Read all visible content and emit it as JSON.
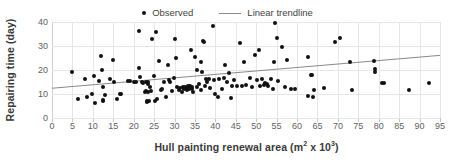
{
  "chart_data": {
    "type": "scatter",
    "title": "",
    "xlabel": "Hull painting renewal area (m² x 10³)",
    "ylabel": "Repairing time (day)",
    "xlim": [
      0,
      95
    ],
    "ylim": [
      0,
      40
    ],
    "xticks": [
      0,
      5,
      10,
      15,
      20,
      25,
      30,
      35,
      40,
      45,
      50,
      55,
      60,
      65,
      70,
      75,
      80,
      85,
      90,
      95
    ],
    "yticks": [
      0,
      10,
      20,
      30,
      40
    ],
    "grid": true,
    "legend_position": "top-center",
    "marker_color": "#111111",
    "trendline_color": "#8a8a8a",
    "gridline_color": "#e6e6e6",
    "series": [
      {
        "name": "Observed",
        "type": "scatter",
        "points": [
          [
            5.0,
            19.1
          ],
          [
            6.3,
            8.1
          ],
          [
            8.2,
            16.2
          ],
          [
            8.6,
            8.6
          ],
          [
            9.8,
            10.2
          ],
          [
            10.3,
            17.3
          ],
          [
            10.6,
            6.2
          ],
          [
            11.4,
            15.6
          ],
          [
            12.0,
            26.0
          ],
          [
            12.3,
            20.2
          ],
          [
            12.4,
            7.0
          ],
          [
            12.5,
            13.0
          ],
          [
            12.6,
            7.4
          ],
          [
            13.0,
            9.5
          ],
          [
            14.2,
            16.1
          ],
          [
            15.0,
            24.0
          ],
          [
            15.3,
            15.1
          ],
          [
            16.0,
            8.1
          ],
          [
            16.6,
            10.2
          ],
          [
            17.0,
            10.1
          ],
          [
            18.7,
            15.3
          ],
          [
            19.2,
            15.4
          ],
          [
            20.0,
            15.1
          ],
          [
            20.6,
            15.2
          ],
          [
            21.2,
            36.2
          ],
          [
            21.4,
            21.0
          ],
          [
            21.6,
            17.0
          ],
          [
            22.0,
            15.2
          ],
          [
            22.4,
            14.4
          ],
          [
            22.7,
            11.0
          ],
          [
            23.0,
            14.9
          ],
          [
            23.1,
            11.2
          ],
          [
            23.2,
            7.2
          ],
          [
            23.3,
            6.6
          ],
          [
            23.4,
            10.7
          ],
          [
            23.5,
            14.2
          ],
          [
            23.6,
            15.0
          ],
          [
            23.8,
            6.9
          ],
          [
            24.0,
            13.0
          ],
          [
            24.2,
            11.1
          ],
          [
            24.6,
            33.0
          ],
          [
            25.0,
            17.3
          ],
          [
            25.2,
            7.2
          ],
          [
            25.4,
            36.0
          ],
          [
            25.6,
            8.0
          ],
          [
            26.2,
            23.9
          ],
          [
            26.6,
            11.5
          ],
          [
            27.0,
            12.0
          ],
          [
            27.4,
            15.1
          ],
          [
            28.0,
            8.6
          ],
          [
            28.4,
            21.9
          ],
          [
            28.6,
            16.0
          ],
          [
            29.0,
            14.8
          ],
          [
            29.4,
            11.4
          ],
          [
            29.8,
            16.5
          ],
          [
            30.2,
            33.0
          ],
          [
            30.4,
            25.0
          ],
          [
            30.6,
            13.0
          ],
          [
            31.0,
            11.6
          ],
          [
            31.4,
            12.6
          ],
          [
            31.8,
            10.7
          ],
          [
            32.0,
            13.1
          ],
          [
            32.2,
            12.4
          ],
          [
            32.4,
            12.0
          ],
          [
            32.6,
            13.0
          ],
          [
            32.8,
            12.4
          ],
          [
            33.0,
            11.8
          ],
          [
            33.2,
            13.2
          ],
          [
            33.4,
            12.6
          ],
          [
            33.6,
            12.0
          ],
          [
            33.8,
            13.4
          ],
          [
            34.0,
            28.2
          ],
          [
            34.2,
            12.2
          ],
          [
            34.4,
            13.0
          ],
          [
            34.6,
            11.0
          ],
          [
            35.0,
            25.6
          ],
          [
            35.4,
            19.8
          ],
          [
            35.6,
            13.0
          ],
          [
            36.0,
            14.0
          ],
          [
            36.4,
            11.6
          ],
          [
            36.6,
            23.4
          ],
          [
            36.8,
            19.2
          ],
          [
            37.0,
            32.2
          ],
          [
            37.1,
            31.8
          ],
          [
            37.4,
            13.4
          ],
          [
            37.8,
            16.1
          ],
          [
            38.0,
            15.0
          ],
          [
            38.4,
            16.2
          ],
          [
            38.8,
            12.6
          ],
          [
            39.4,
            38.2
          ],
          [
            39.6,
            15.9
          ],
          [
            40.0,
            9.8
          ],
          [
            40.6,
            8.8
          ],
          [
            41.0,
            16.1
          ],
          [
            41.6,
            12.2
          ],
          [
            42.0,
            16.6
          ],
          [
            42.4,
            22.0
          ],
          [
            42.8,
            15.2
          ],
          [
            43.4,
            18.6
          ],
          [
            43.8,
            8.4
          ],
          [
            44.0,
            13.4
          ],
          [
            44.6,
            15.7
          ],
          [
            45.4,
            13.2
          ],
          [
            46.0,
            31.2
          ],
          [
            46.6,
            13.2
          ],
          [
            47.0,
            23.4
          ],
          [
            47.4,
            13.6
          ],
          [
            48.6,
            16.5
          ],
          [
            49.0,
            13.0
          ],
          [
            49.6,
            26.4
          ],
          [
            50.2,
            16.0
          ],
          [
            50.6,
            28.2
          ],
          [
            51.0,
            13.3
          ],
          [
            51.4,
            16.2
          ],
          [
            51.8,
            13.6
          ],
          [
            52.2,
            14.4
          ],
          [
            52.6,
            14.0
          ],
          [
            53.0,
            13.2
          ],
          [
            53.6,
            16.3
          ],
          [
            54.0,
            12.0
          ],
          [
            54.4,
            23.2
          ],
          [
            54.6,
            39.5
          ],
          [
            55.0,
            33.2
          ],
          [
            55.4,
            15.4
          ],
          [
            56.4,
            29.4
          ],
          [
            57.0,
            13.0
          ],
          [
            57.6,
            24.2
          ],
          [
            58.4,
            12.2
          ],
          [
            59.6,
            12.2
          ],
          [
            62.6,
            9.3
          ],
          [
            62.8,
            25.4
          ],
          [
            63.4,
            18.0
          ],
          [
            63.6,
            17.8
          ],
          [
            64.0,
            8.6
          ],
          [
            64.2,
            11.8
          ],
          [
            66.6,
            12.3
          ],
          [
            69.2,
            31.5
          ],
          [
            70.4,
            33.4
          ],
          [
            73.0,
            23.4
          ],
          [
            73.4,
            11.5
          ],
          [
            78.8,
            23.6
          ],
          [
            79.0,
            20.4
          ],
          [
            79.1,
            19.0
          ],
          [
            80.8,
            14.6
          ],
          [
            81.4,
            14.6
          ],
          [
            87.4,
            11.5
          ],
          [
            92.2,
            14.6
          ]
        ]
      },
      {
        "name": "Linear trendline",
        "type": "line",
        "endpoints": [
          [
            0,
            12.4
          ],
          [
            95,
            26.1
          ]
        ]
      }
    ]
  },
  "legend": {
    "entries": [
      {
        "label": "Observed",
        "marker": "dot"
      },
      {
        "label": "Linear trendline",
        "marker": "line"
      }
    ]
  },
  "axes": {
    "y_title": "Repairing time (day)",
    "x_title_main": "Hull painting renewal area (m",
    "x_title_sup1": "2",
    "x_title_mid": " x 10",
    "x_title_sup2": "3",
    "x_title_end": ")"
  }
}
